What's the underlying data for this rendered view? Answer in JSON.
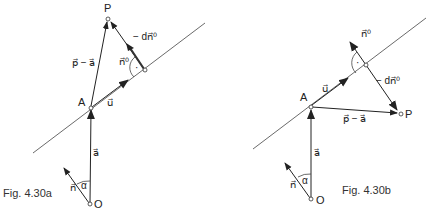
{
  "figures": [
    {
      "id": "fig-a",
      "caption": "Fig. 4.30a",
      "points": {
        "P": "P",
        "A": "A",
        "O": "O"
      },
      "vectors": {
        "a": "a⃗",
        "u": "u⃗",
        "n": "n⃗",
        "n0": "n⃗⁰",
        "p_minus_a": "p⃗ − a⃗",
        "minus_d_n0": "− dn⃗⁰"
      },
      "angle": "α",
      "right_angle_mark": "·"
    },
    {
      "id": "fig-b",
      "caption": "Fig. 4.30b",
      "points": {
        "P": "P",
        "A": "A",
        "O": "O"
      },
      "vectors": {
        "a": "a⃗",
        "u": "u⃗",
        "n": "n⃗",
        "n0": "n⃗⁰",
        "p_minus_a": "p⃗ − a⃗",
        "minus_d_n0": "− dn⃗⁰"
      },
      "angle": "α",
      "right_angle_mark": "·"
    }
  ]
}
